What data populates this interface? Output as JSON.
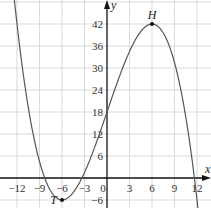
{
  "chart_data": {
    "type": "line",
    "title": "",
    "function": "f(x) = -x^3/18 + 6x + 18",
    "xlabel": "x",
    "ylabel": "y",
    "xlim": [
      -13.5,
      13.5
    ],
    "ylim": [
      -8,
      48
    ],
    "grid": true,
    "x_ticks": [
      -12,
      -9,
      -6,
      -3,
      0,
      3,
      6,
      9,
      12
    ],
    "y_ticks": [
      -6,
      6,
      12,
      18,
      24,
      30,
      36,
      42
    ],
    "series": [
      {
        "name": "curve",
        "x": [
          -12,
          -11,
          -10,
          -9,
          -8,
          -7,
          -6,
          -5,
          -4,
          -3,
          -2,
          -1,
          0,
          1,
          2,
          3,
          4,
          5,
          6,
          7,
          8,
          9,
          10,
          11,
          12
        ],
        "values": [
          42,
          26.9,
          13.6,
          4.5,
          -1.6,
          -4.9,
          -6,
          -5.1,
          -2.4,
          1.5,
          6.4,
          12.1,
          18,
          23.9,
          29.6,
          34.5,
          38.4,
          41.1,
          42,
          40.9,
          37.6,
          31.5,
          22.4,
          10.1,
          -6
        ]
      }
    ],
    "points": [
      {
        "label": "H",
        "x": 6,
        "y": 42
      },
      {
        "label": "T",
        "x": -6,
        "y": -6
      }
    ],
    "colors": {
      "curve": "#555555",
      "grid": "#d9d9d9",
      "axis": "#111111"
    }
  }
}
